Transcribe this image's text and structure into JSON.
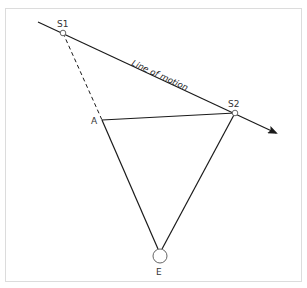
{
  "diagram": {
    "labels": {
      "s1": "S1",
      "s2": "S2",
      "a": "A",
      "e": "E",
      "motion": "Line of motion"
    },
    "colors": {
      "line": "#1a1a1a",
      "frame": "#dcdcdc",
      "text": "#333333"
    },
    "points": {
      "line_start": [
        38,
        22
      ],
      "S1": [
        63,
        33
      ],
      "A": [
        102,
        120
      ],
      "S2": [
        235,
        113
      ],
      "arrow_tip": [
        278,
        134
      ],
      "E": [
        160,
        255
      ]
    }
  }
}
